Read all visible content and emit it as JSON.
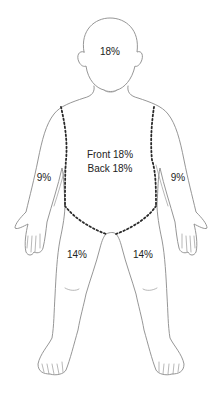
{
  "diagram": {
    "type": "body-surface-area-chart",
    "regions": {
      "head": {
        "label": "18%"
      },
      "trunk": {
        "front_label": "Front 18%",
        "back_label": "Back 18%"
      },
      "left_arm": {
        "label": "9%"
      },
      "right_arm": {
        "label": "9%"
      },
      "left_leg": {
        "label": "14%"
      },
      "right_leg": {
        "label": "14%"
      }
    },
    "colors": {
      "outline": "#8a8a8a",
      "dotted_boundary": "#2a2a2a",
      "label_text": "#222222",
      "background": "#ffffff"
    }
  }
}
